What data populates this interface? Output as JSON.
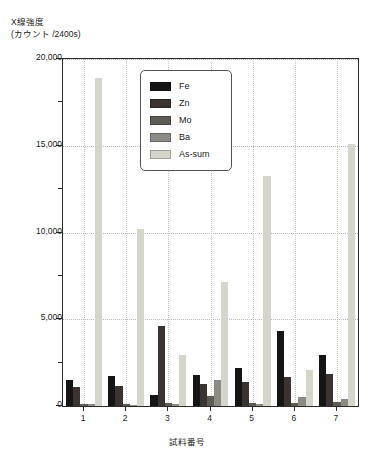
{
  "chart_data": {
    "type": "bar",
    "title": "",
    "ylabel": "X線強度\n(カウント /2400s)",
    "ylabel_line1": "X線強度",
    "ylabel_line2": "(カウント /2400s)",
    "xlabel": "試料番号",
    "categories": [
      "1",
      "2",
      "3",
      "4",
      "5",
      "6",
      "7"
    ],
    "ylim": [
      0,
      20000
    ],
    "ytick_labels": [
      "0",
      "5,000",
      "10,000",
      "15,000",
      "20,000"
    ],
    "ytick_values": [
      0,
      5000,
      10000,
      15000,
      20000
    ],
    "yminor_values": [
      2500,
      7500,
      12500,
      17500
    ],
    "grid": "dotted",
    "legend_position": "inside-top-center",
    "series": [
      {
        "name": "Fe",
        "color": "#151515",
        "values": [
          1500,
          1750,
          650,
          1800,
          2200,
          4350,
          2950
        ]
      },
      {
        "name": "Zn",
        "color": "#3a3330",
        "values": [
          1100,
          1150,
          4600,
          1250,
          1400,
          1700,
          1850
        ]
      },
      {
        "name": "Mo",
        "color": "#5e5a55",
        "values": [
          120,
          110,
          180,
          600,
          150,
          180,
          250
        ]
      },
      {
        "name": "Ba",
        "color": "#8c8a84",
        "values": [
          90,
          80,
          130,
          1500,
          120,
          500,
          420
        ]
      },
      {
        "name": "As-sum",
        "color": "#d6d5cb",
        "values": [
          18900,
          10200,
          2950,
          7150,
          13250,
          2100,
          15100
        ]
      }
    ]
  },
  "legend": {
    "items": [
      {
        "label": "Fe"
      },
      {
        "label": "Zn"
      },
      {
        "label": "Mo"
      },
      {
        "label": "Ba"
      },
      {
        "label": "As-sum"
      }
    ]
  }
}
